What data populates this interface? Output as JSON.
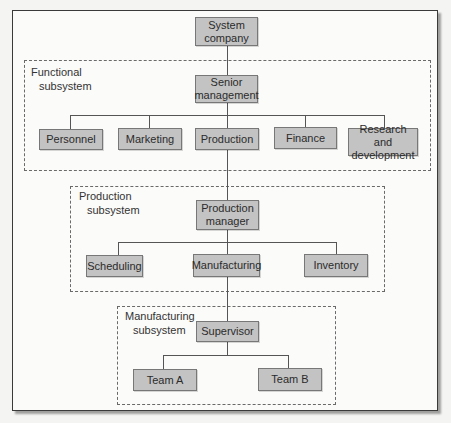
{
  "diagram": {
    "type": "hierarchy",
    "root": {
      "line1": "System",
      "line2": "company"
    },
    "functional_subsystem": {
      "label_line1": "Functional",
      "label_line2": "subsystem",
      "head": {
        "line1": "Senior",
        "line2": "management"
      },
      "children": [
        "Personnel",
        "Marketing",
        "Production",
        "Finance"
      ],
      "rd": {
        "line1": "Research and",
        "line2": "development"
      }
    },
    "production_subsystem": {
      "label_line1": "Production",
      "label_line2": "subsystem",
      "head": {
        "line1": "Production",
        "line2": "manager"
      },
      "children": [
        "Scheduling",
        "Manufacturing",
        "Inventory"
      ]
    },
    "manufacturing_subsystem": {
      "label_line1": "Manufacturing",
      "label_line2": "subsystem",
      "head": "Supervisor",
      "children": [
        "Team A",
        "Team B"
      ]
    },
    "colors": {
      "node_fill": "#c3c3c3",
      "node_border": "#777777",
      "line": "#555555",
      "background": "#fbfbfa"
    }
  }
}
